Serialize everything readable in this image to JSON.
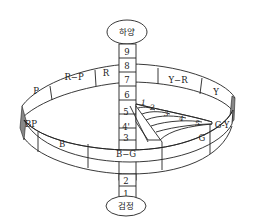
{
  "diagram": {
    "type": "munsell-color-solid",
    "top_label": "하양",
    "bottom_label": "검정",
    "value_scale": [
      "1",
      "2",
      "3",
      "4'",
      "5",
      "6",
      "7",
      "8",
      "9"
    ],
    "chroma_scale": [
      "1",
      "2",
      "3",
      "4",
      "5"
    ],
    "hue_ring_labels": {
      "P": "P",
      "R_P": "R−P",
      "R": "R",
      "Y_R": "Y−R",
      "Y": "Y",
      "G_Y": "G-Y",
      "G": "G",
      "B_G": "B−G",
      "B": "B",
      "BP": "BP"
    },
    "colors": {
      "stroke": "#222222",
      "background": "#ffffff"
    }
  }
}
